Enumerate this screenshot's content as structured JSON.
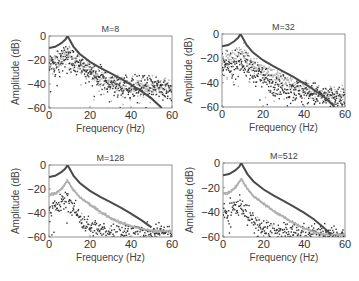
{
  "chart_data": [
    {
      "type": "scatter",
      "title": "M=8",
      "xlabel": "Frequency (Hz)",
      "ylabel": "Amplitude (dB)",
      "xlim": [
        0,
        60
      ],
      "ylim": [
        -60,
        0
      ],
      "xticks": [
        0,
        20,
        40,
        60
      ],
      "yticks": [
        0,
        -20,
        -40,
        -60
      ],
      "grid": false,
      "series": [
        {
          "name": "theoretical",
          "style": "line",
          "color": "#4a4a4a",
          "x": [
            0,
            3,
            6,
            8,
            9,
            10,
            12,
            15,
            20,
            25,
            30,
            35,
            40,
            45,
            50,
            55
          ],
          "values": [
            -10,
            -9,
            -6,
            -3,
            0,
            -3,
            -9,
            -15,
            -21.5,
            -26.5,
            -31,
            -35.5,
            -40.5,
            -46,
            -52,
            -60
          ]
        },
        {
          "name": "estimate-light",
          "style": "points",
          "color": "#b0b0b0",
          "x": [
            0,
            5,
            9,
            12,
            20,
            30,
            40,
            50,
            60
          ],
          "values": [
            -22,
            -20,
            -15,
            -20,
            -30,
            -38,
            -42,
            -42,
            -43
          ]
        },
        {
          "name": "estimate-dark",
          "style": "points",
          "color": "#333333",
          "x": [
            0,
            5,
            9,
            12,
            20,
            30,
            40,
            50,
            60
          ],
          "values": [
            -24,
            -22,
            -16,
            -22,
            -32,
            -40,
            -43,
            -43,
            -44
          ]
        }
      ]
    },
    {
      "type": "scatter",
      "title": "M=32",
      "xlabel": "Frequency (Hz)",
      "ylabel": "Amplitude (dB)",
      "xlim": [
        0,
        60
      ],
      "ylim": [
        -60,
        0
      ],
      "xticks": [
        0,
        20,
        40,
        60
      ],
      "yticks": [
        0,
        -20,
        -40,
        -60
      ],
      "grid": false,
      "series": [
        {
          "name": "theoretical",
          "style": "line",
          "color": "#4a4a4a",
          "x": [
            0,
            3,
            6,
            8,
            9,
            10,
            12,
            15,
            20,
            25,
            30,
            35,
            40,
            45,
            50,
            55
          ],
          "values": [
            -10,
            -9,
            -6,
            -3,
            0,
            -3,
            -9,
            -15,
            -21.5,
            -26.5,
            -31,
            -35.5,
            -40.5,
            -46,
            -52,
            -60
          ]
        },
        {
          "name": "estimate-light",
          "style": "points",
          "color": "#b0b0b0",
          "x": [
            0,
            5,
            9,
            12,
            20,
            30,
            40,
            50,
            60
          ],
          "values": [
            -22,
            -20,
            -14,
            -20,
            -30,
            -38,
            -44,
            -50,
            -52
          ]
        },
        {
          "name": "estimate-dark",
          "style": "points",
          "color": "#333333",
          "x": [
            0,
            5,
            9,
            12,
            20,
            30,
            40,
            50,
            60
          ],
          "values": [
            -28,
            -26,
            -22,
            -27,
            -36,
            -44,
            -48,
            -52,
            -54
          ]
        }
      ]
    },
    {
      "type": "scatter",
      "title": "M=128",
      "xlabel": "Frequency (Hz)",
      "ylabel": "Amplitude (dB)",
      "xlim": [
        0,
        60
      ],
      "ylim": [
        -60,
        0
      ],
      "xticks": [
        0,
        20,
        40,
        60
      ],
      "yticks": [
        0,
        -20,
        -40,
        -60
      ],
      "grid": false,
      "series": [
        {
          "name": "theoretical",
          "style": "line",
          "color": "#4a4a4a",
          "x": [
            0,
            3,
            6,
            8,
            9,
            10,
            12,
            15,
            20,
            25,
            30,
            35,
            40,
            45,
            50
          ],
          "values": [
            -10,
            -9,
            -6,
            -3,
            0,
            -3,
            -9,
            -15,
            -21.5,
            -26.5,
            -31,
            -35.5,
            -40.5,
            -46,
            -52
          ]
        },
        {
          "name": "estimate-light",
          "style": "points",
          "color": "#b0b0b0",
          "x": [
            0,
            3,
            6,
            9,
            12,
            15,
            20,
            25,
            30,
            35,
            40,
            45,
            50,
            55,
            60
          ],
          "values": [
            -25,
            -24,
            -20,
            -13,
            -21,
            -27,
            -33,
            -39,
            -44,
            -48,
            -51,
            -53,
            -55,
            -55,
            -55
          ]
        },
        {
          "name": "estimate-dark",
          "style": "points",
          "color": "#333333",
          "x": [
            0,
            3,
            6,
            9,
            12,
            15,
            20,
            25,
            30,
            40,
            50,
            60
          ],
          "values": [
            -40,
            -36,
            -32,
            -28,
            -36,
            -44,
            -52,
            -55,
            -56,
            -57,
            -57,
            -56
          ]
        }
      ]
    },
    {
      "type": "scatter",
      "title": "M=512",
      "xlabel": "Frequency (Hz)",
      "ylabel": "Amplitude (dB)",
      "xlim": [
        0,
        60
      ],
      "ylim": [
        -60,
        0
      ],
      "xticks": [
        0,
        20,
        40,
        60
      ],
      "yticks": [
        0,
        -20,
        -40,
        -60
      ],
      "grid": false,
      "series": [
        {
          "name": "theoretical",
          "style": "line",
          "color": "#4a4a4a",
          "x": [
            0,
            3,
            6,
            8,
            9,
            10,
            12,
            15,
            20,
            25,
            30,
            35,
            40,
            45,
            50,
            53
          ],
          "values": [
            -10,
            -9,
            -6,
            -3,
            0,
            -3,
            -9,
            -15,
            -21.5,
            -26.5,
            -31,
            -35.5,
            -40.5,
            -46,
            -53,
            -58
          ]
        },
        {
          "name": "estimate-light",
          "style": "points",
          "color": "#b0b0b0",
          "x": [
            0,
            3,
            6,
            9,
            12,
            15,
            20,
            25,
            30,
            35,
            40,
            45,
            50,
            55
          ],
          "values": [
            -25,
            -24,
            -20,
            -13,
            -21,
            -27,
            -33,
            -39,
            -44,
            -49,
            -53,
            -56,
            -58,
            -58
          ]
        },
        {
          "name": "estimate-dark",
          "style": "points",
          "color": "#333333",
          "x": [
            0,
            3,
            6,
            9,
            12,
            15,
            20,
            30,
            40,
            50,
            60
          ],
          "values": [
            -42,
            -40,
            -36,
            -33,
            -42,
            -48,
            -54,
            -57,
            -58,
            -58,
            -58
          ]
        }
      ]
    }
  ]
}
